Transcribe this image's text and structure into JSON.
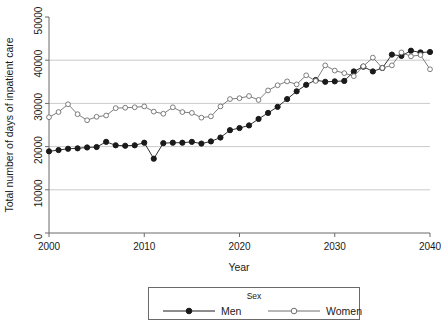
{
  "chart_data": {
    "type": "line",
    "title": "",
    "xlabel": "Year",
    "ylabel": "Total number of days of inpatient care",
    "xlim": [
      2000,
      2040
    ],
    "ylim": [
      0,
      50000
    ],
    "xticks": [
      2000,
      2010,
      2020,
      2030,
      2040
    ],
    "xtick_labels": [
      "2000",
      "2010",
      "2020",
      "2030",
      "2040"
    ],
    "yticks": [
      0,
      10000,
      20000,
      30000,
      40000,
      50000
    ],
    "ytick_labels": [
      "0",
      "10000",
      "20000",
      "30000",
      "40000",
      "50000"
    ],
    "grid": "horizontal",
    "gridlines_at": [
      10000,
      20000,
      30000,
      40000
    ],
    "legend": {
      "title": "Sex",
      "position": "bottom-outside",
      "entries": [
        "Men",
        "Women"
      ]
    },
    "x": [
      2000,
      2001,
      2002,
      2003,
      2004,
      2005,
      2006,
      2007,
      2008,
      2009,
      2010,
      2011,
      2012,
      2013,
      2014,
      2015,
      2016,
      2017,
      2018,
      2019,
      2020,
      2021,
      2022,
      2023,
      2024,
      2025,
      2026,
      2027,
      2028,
      2029,
      2030,
      2031,
      2032,
      2033,
      2034,
      2035,
      2036,
      2037,
      2038,
      2039,
      2040
    ],
    "series": [
      {
        "name": "Men",
        "marker": "filled-circle",
        "color": "#1a1a1a",
        "values": [
          18900,
          19200,
          19500,
          19600,
          19800,
          19900,
          21100,
          20300,
          20200,
          20300,
          20900,
          17200,
          20800,
          20900,
          20900,
          21100,
          20700,
          21200,
          22100,
          23800,
          24300,
          24900,
          26400,
          27800,
          29200,
          31000,
          32800,
          34300,
          35400,
          35000,
          35100,
          35200,
          37400,
          38500,
          37400,
          38200,
          41300,
          41000,
          42200,
          41800,
          41900
        ]
      },
      {
        "name": "Women",
        "marker": "open-circle",
        "color": "#6e6e6e",
        "values": [
          26800,
          28000,
          29800,
          27500,
          26100,
          26900,
          27200,
          28900,
          29000,
          29100,
          29300,
          28100,
          27600,
          29100,
          28000,
          27800,
          26700,
          27000,
          29300,
          31000,
          31200,
          31700,
          30800,
          33000,
          34200,
          35100,
          34400,
          36500,
          35200,
          38800,
          37600,
          37000,
          36300,
          38600,
          40600,
          38200,
          38800,
          41800,
          40900,
          41200,
          37900
        ]
      }
    ]
  }
}
